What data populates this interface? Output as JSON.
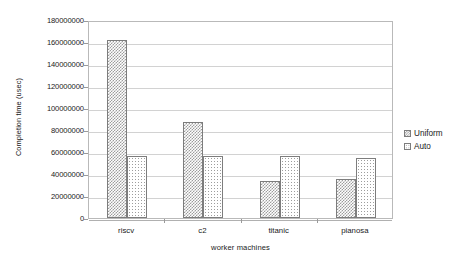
{
  "chart_data": {
    "type": "bar",
    "title": "",
    "xlabel": "worker machines",
    "ylabel": "Completion time (usec)",
    "categories": [
      "riscv",
      "c2",
      "titanic",
      "pianosa"
    ],
    "series": [
      {
        "name": "Uniform",
        "values": [
          162000000,
          87000000,
          34000000,
          35500000
        ]
      },
      {
        "name": "Auto",
        "values": [
          56000000,
          56000000,
          56000000,
          55000000
        ]
      }
    ],
    "ylim": [
      0,
      180000000
    ],
    "ytick_values": [
      0,
      20000000,
      40000000,
      60000000,
      80000000,
      100000000,
      120000000,
      140000000,
      160000000,
      180000000
    ],
    "ytick_labels": [
      "0",
      "20000000",
      "40000000",
      "60000000",
      "80000000",
      "100000000",
      "120000000",
      "140000000",
      "160000000",
      "180000000"
    ],
    "grid": true,
    "grid_axis": "y",
    "legend_position": "right",
    "legend": [
      "Uniform",
      "Auto"
    ],
    "colors": {
      "series_uniform_pattern": "#9d9d9d",
      "series_auto_pattern": "#9d9d9d",
      "bar_outline": "#7d7d7d",
      "gridline": "#d2d2d2",
      "axis": "#b9b9b9",
      "background": "#ffffff",
      "text": "#1a1a1a"
    }
  }
}
